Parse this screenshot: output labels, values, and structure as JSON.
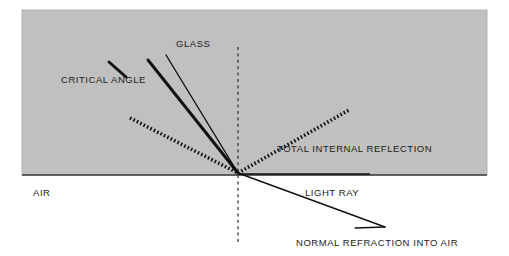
{
  "figure": {
    "width": 509,
    "height": 256,
    "background_color": "#ffffff"
  },
  "media": {
    "glass": {
      "label": "GLASS",
      "fill_color": "#c0c0c0",
      "region": {
        "x": 22,
        "y": 10,
        "width": 465,
        "height": 165
      }
    },
    "air": {
      "label": "AIR",
      "fill_color": "#ffffff"
    },
    "interface": {
      "color": "#333333",
      "y": 175
    }
  },
  "labels": {
    "glass": "GLASS",
    "air": "AIR",
    "critical_angle": "CRITICAL ANGLE",
    "total_internal_reflection": "TOTAL INTERNAL REFLECTION",
    "light_ray": "LIGHT RAY",
    "normal_refraction": "NORMAL REFRACTION INTO AIR"
  },
  "label_positions": {
    "glass": {
      "x": 176,
      "y": 47
    },
    "air": {
      "x": 33,
      "y": 196
    },
    "critical_angle": {
      "x": 61,
      "y": 83
    },
    "total_internal_reflection": {
      "x": 277,
      "y": 152
    },
    "light_ray": {
      "x": 305,
      "y": 196
    },
    "normal_refraction": {
      "x": 296,
      "y": 246
    }
  },
  "geometry": {
    "incidence_point": {
      "x": 238,
      "y": 173
    },
    "normal_line": {
      "name": "normal",
      "x": 238,
      "y_top": 47,
      "y_bottom": 245,
      "style": "dashed",
      "color": "#333333"
    },
    "rays": [
      {
        "name": "critical-angle-incident-ray",
        "style": "solid-thick",
        "color": "#111111",
        "width": 3.0,
        "from": {
          "x": 148,
          "y": 60
        },
        "to": {
          "x": 238,
          "y": 173
        }
      },
      {
        "name": "shallow-incident-ray",
        "style": "solid-thin",
        "color": "#111111",
        "width": 1.4,
        "from": {
          "x": 166,
          "y": 55
        },
        "to": {
          "x": 238,
          "y": 173
        }
      },
      {
        "name": "totally-reflected-incident-ray",
        "style": "dotted-thick",
        "color": "#111111",
        "width": 3.6,
        "from": {
          "x": 130,
          "y": 118
        },
        "to": {
          "x": 238,
          "y": 173
        }
      },
      {
        "name": "total-internal-reflection-ray",
        "style": "dotted-thick",
        "color": "#111111",
        "width": 3.6,
        "from": {
          "x": 238,
          "y": 173
        },
        "to": {
          "x": 349,
          "y": 110
        }
      },
      {
        "name": "grazing-refracted-ray",
        "style": "solid-thin",
        "color": "#111111",
        "width": 1.4,
        "from": {
          "x": 238,
          "y": 174
        },
        "to": {
          "x": 370,
          "y": 174
        }
      },
      {
        "name": "normal-refracted-ray",
        "style": "solid-thin",
        "color": "#111111",
        "width": 1.4,
        "from": {
          "x": 238,
          "y": 173
        },
        "to": {
          "x": 385,
          "y": 227
        }
      },
      {
        "name": "critical-angle-leader-line",
        "style": "solid-thick",
        "color": "#111111",
        "width": 3.0,
        "from": {
          "x": 109,
          "y": 62
        },
        "to": {
          "x": 126,
          "y": 77
        }
      },
      {
        "name": "normal-refraction-leader-line",
        "style": "solid-thin",
        "color": "#111111",
        "width": 1.3,
        "from": {
          "x": 355,
          "y": 228
        },
        "to": {
          "x": 385,
          "y": 227
        }
      }
    ]
  }
}
